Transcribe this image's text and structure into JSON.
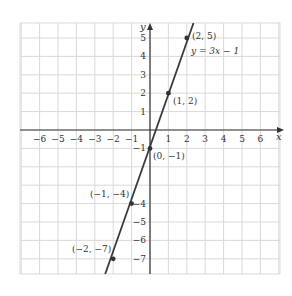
{
  "chart_data": {
    "type": "line",
    "title": "",
    "xlabel": "x",
    "ylabel": "y",
    "xlim": [
      -7,
      7
    ],
    "ylim": [
      -8,
      6
    ],
    "grid": true,
    "x_ticks": [
      -6,
      -5,
      -4,
      -3,
      -2,
      -1,
      1,
      2,
      3,
      4,
      5,
      6
    ],
    "x_tick_labels": [
      "−6",
      "−5",
      "−4",
      "−3",
      "−2",
      "−1",
      "1",
      "2",
      "3",
      "4",
      "5",
      "6"
    ],
    "y_ticks": [
      5,
      4,
      3,
      2,
      1,
      -1,
      -4,
      -5,
      -6,
      -7
    ],
    "y_tick_labels": [
      "5",
      "4",
      "3",
      "2",
      "1",
      "−1",
      "−4",
      "−5",
      "−6",
      "−7"
    ],
    "series": [
      {
        "name": "y = 3x − 1",
        "equation": "y = 3x − 1",
        "slope": 3,
        "intercept": -1,
        "points": [
          {
            "x": 2,
            "y": 5,
            "label": "(2, 5)"
          },
          {
            "x": 1,
            "y": 2,
            "label": "(1, 2)"
          },
          {
            "x": 0,
            "y": -1,
            "label": "(0, −1)"
          },
          {
            "x": -1,
            "y": -4,
            "label": "(−1, −4)"
          },
          {
            "x": -2,
            "y": -7,
            "label": "(−2, −7)"
          }
        ]
      }
    ],
    "annotations": [
      {
        "text": "y = 3x − 1",
        "near": {
          "x": 2,
          "y": 5
        }
      }
    ]
  },
  "labels": {
    "x_axis": "x",
    "y_axis": "y",
    "equation": "y = 3x − 1",
    "p1": "(2, 5)",
    "p2": "(1, 2)",
    "p3": "(0, −1)",
    "p4": "(−1, −4)",
    "p5": "(−2, −7)",
    "xt": [
      "−6",
      "−5",
      "−4",
      "−3",
      "−2",
      "−1",
      "1",
      "2",
      "3",
      "4",
      "5",
      "6"
    ],
    "yt": [
      "5",
      "4",
      "3",
      "2",
      "1",
      "−1",
      "−4",
      "−5",
      "−6",
      "−7"
    ]
  },
  "colors": {
    "grid": "#d9d9d9",
    "axis": "#333333",
    "line": "#3a3a3a",
    "point": "#333333"
  }
}
